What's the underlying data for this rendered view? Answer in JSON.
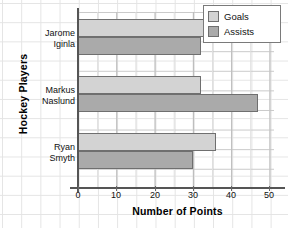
{
  "chart_data": {
    "type": "bar",
    "orientation": "horizontal",
    "title": "",
    "xlabel": "Number of Points",
    "ylabel": "Hockey Players",
    "categories": [
      "Jarome Iginla",
      "Markus Naslund",
      "Ryan Smyth"
    ],
    "category_lines": [
      [
        "Jarome",
        "Iginla"
      ],
      [
        "Markus",
        "Naslund"
      ],
      [
        "Ryan",
        "Smyth"
      ]
    ],
    "series": [
      {
        "name": "Goals",
        "color": "#d3d3d3",
        "values": [
          35,
          32,
          36
        ]
      },
      {
        "name": "Assists",
        "color": "#aaaaaa",
        "values": [
          32,
          47,
          30
        ]
      }
    ],
    "xlim": [
      0,
      55
    ],
    "xticks": [
      0,
      10,
      20,
      30,
      40,
      50
    ],
    "xtick_labels": [
      "0",
      "10",
      "20",
      "30",
      "40",
      "50"
    ],
    "grid": true,
    "legend_position": "top-right",
    "legend_entries": [
      "Goals",
      "Assists"
    ]
  },
  "legend": {
    "items": [
      {
        "label": "Goals",
        "swatch": "goals"
      },
      {
        "label": "Assists",
        "swatch": "assists"
      }
    ]
  },
  "axes": {
    "x_title": "Number of Points",
    "y_title": "Hockey Players"
  }
}
